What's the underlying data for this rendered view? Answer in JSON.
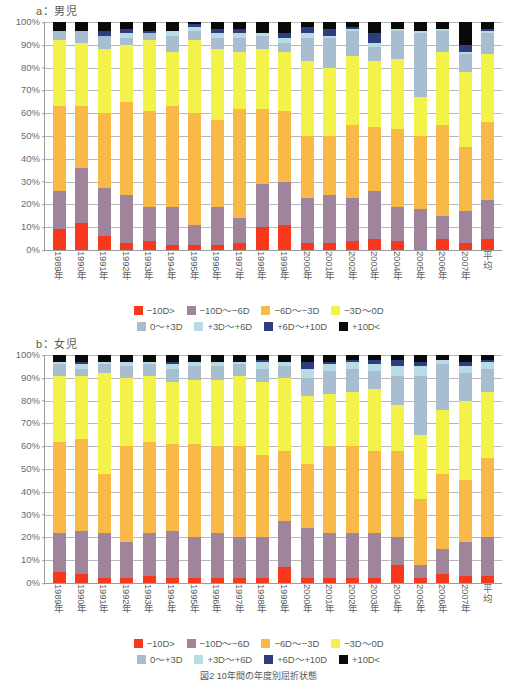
{
  "figure": {
    "caption": "図2 10年間の年度別屈折状態"
  },
  "axis": {
    "yticks": [
      "100%",
      "90%",
      "80%",
      "70%",
      "60%",
      "50%",
      "40%",
      "30%",
      "20%",
      "10%",
      "0%"
    ],
    "categories": [
      "1989年",
      "1990年",
      "1991年",
      "1992年",
      "1993年",
      "1994年",
      "1995年",
      "1996年",
      "1997年",
      "1998年",
      "1999年",
      "2000年",
      "2001年",
      "2002年",
      "2003年",
      "2004年",
      "2005年",
      "2006年",
      "2007年",
      "平均"
    ]
  },
  "legend": {
    "row1": [
      {
        "label": "−10D>",
        "color": "#f8381c"
      },
      {
        "label": "−10D〜−6D",
        "color": "#a0849b"
      },
      {
        "label": "−6D〜−3D",
        "color": "#f9b949"
      },
      {
        "label": "−3D〜0D",
        "color": "#f2f24a"
      }
    ],
    "row2": [
      {
        "label": "0〜+3D",
        "color": "#a8bdd0"
      },
      {
        "label": "+3D〜+6D",
        "color": "#b8dce4"
      },
      {
        "label": "+6D〜+10D",
        "color": "#2e3c80"
      },
      {
        "label": "+10D<",
        "color": "#0a0a0a"
      }
    ]
  },
  "panels": [
    {
      "id": "a",
      "title": "a：男児"
    },
    {
      "id": "b",
      "title": "b：女児"
    }
  ],
  "chart_data": [
    {
      "type": "bar",
      "stacked": true,
      "normalized": true,
      "title": "a：男児",
      "xlabel": "",
      "ylabel": "",
      "ylim": [
        0,
        100
      ],
      "grid": true,
      "legend_position": "bottom",
      "categories": [
        "1989年",
        "1990年",
        "1991年",
        "1992年",
        "1993年",
        "1994年",
        "1995年",
        "1996年",
        "1997年",
        "1998年",
        "1999年",
        "2000年",
        "2001年",
        "2002年",
        "2003年",
        "2004年",
        "2005年",
        "2006年",
        "2007年",
        "平均"
      ],
      "series": [
        {
          "name": "−10D>",
          "color": "#f8381c",
          "values": [
            9,
            12,
            6,
            3,
            4,
            2,
            2,
            2,
            3,
            10,
            11,
            3,
            3,
            4,
            5,
            4,
            0,
            5,
            3,
            5
          ]
        },
        {
          "name": "−10D〜−6D",
          "color": "#a0849b",
          "values": [
            17,
            24,
            21,
            21,
            15,
            17,
            9,
            17,
            11,
            19,
            19,
            20,
            21,
            19,
            21,
            15,
            18,
            10,
            14,
            17
          ]
        },
        {
          "name": "−6D〜−3D",
          "color": "#f9b949",
          "values": [
            37,
            27,
            33,
            41,
            42,
            44,
            49,
            38,
            48,
            33,
            31,
            27,
            26,
            32,
            28,
            34,
            32,
            40,
            28,
            34
          ]
        },
        {
          "name": "−3D〜0D",
          "color": "#f2f24a",
          "values": [
            29,
            28,
            28,
            25,
            31,
            24,
            32,
            31,
            25,
            26,
            26,
            33,
            30,
            30,
            29,
            31,
            17,
            32,
            33,
            30
          ]
        },
        {
          "name": "0〜+3D",
          "color": "#a8bdd0",
          "values": [
            4,
            5,
            6,
            3,
            3,
            7,
            4,
            5,
            6,
            6,
            4,
            10,
            13,
            11,
            6,
            12,
            28,
            9,
            8,
            9
          ]
        },
        {
          "name": "+3D〜+6D",
          "color": "#b8dce4",
          "values": [
            0,
            0,
            0,
            2,
            0,
            2,
            2,
            2,
            2,
            1,
            2,
            2,
            1,
            1,
            2,
            1,
            1,
            1,
            1,
            1
          ]
        },
        {
          "name": "+6D〜+10D",
          "color": "#2e3c80",
          "values": [
            0,
            0,
            2,
            2,
            1,
            0,
            1,
            2,
            2,
            0,
            2,
            3,
            3,
            1,
            4,
            0,
            0,
            0,
            3,
            1
          ]
        },
        {
          "name": "+10D<",
          "color": "#0a0a0a",
          "values": [
            4,
            4,
            4,
            3,
            4,
            4,
            1,
            3,
            3,
            5,
            5,
            2,
            3,
            2,
            5,
            3,
            4,
            3,
            10,
            3
          ]
        }
      ]
    },
    {
      "type": "bar",
      "stacked": true,
      "normalized": true,
      "title": "b：女児",
      "xlabel": "",
      "ylabel": "",
      "ylim": [
        0,
        100
      ],
      "grid": true,
      "legend_position": "bottom",
      "categories": [
        "1989年",
        "1990年",
        "1991年",
        "1992年",
        "1993年",
        "1994年",
        "1995年",
        "1996年",
        "1997年",
        "1998年",
        "1999年",
        "2000年",
        "2001年",
        "2002年",
        "2003年",
        "2004年",
        "2005年",
        "2006年",
        "2007年",
        "平均"
      ],
      "series": [
        {
          "name": "−10D>",
          "color": "#f8381c",
          "values": [
            5,
            4,
            2,
            2,
            3,
            2,
            2,
            2,
            2,
            2,
            7,
            2,
            2,
            2,
            2,
            8,
            2,
            4,
            3,
            3
          ]
        },
        {
          "name": "−10D〜−6D",
          "color": "#a0849b",
          "values": [
            17,
            19,
            20,
            16,
            19,
            21,
            18,
            20,
            18,
            18,
            20,
            22,
            20,
            20,
            20,
            12,
            6,
            11,
            15,
            17
          ]
        },
        {
          "name": "−6D〜−3D",
          "color": "#f9b949",
          "values": [
            40,
            40,
            26,
            42,
            40,
            38,
            41,
            38,
            40,
            36,
            31,
            28,
            38,
            38,
            36,
            38,
            29,
            33,
            27,
            35
          ]
        },
        {
          "name": "−3D〜0D",
          "color": "#f2f24a",
          "values": [
            29,
            28,
            44,
            30,
            29,
            27,
            28,
            29,
            31,
            32,
            32,
            30,
            23,
            24,
            27,
            20,
            28,
            28,
            35,
            29
          ]
        },
        {
          "name": "0〜+3D",
          "color": "#a8bdd0",
          "values": [
            5,
            3,
            4,
            5,
            5,
            6,
            6,
            6,
            5,
            6,
            5,
            8,
            10,
            10,
            8,
            13,
            26,
            20,
            12,
            10
          ]
        },
        {
          "name": "+3D〜+6D",
          "color": "#b8dce4",
          "values": [
            1,
            2,
            1,
            2,
            1,
            2,
            2,
            2,
            1,
            3,
            2,
            4,
            3,
            3,
            3,
            4,
            4,
            2,
            3,
            3
          ]
        },
        {
          "name": "+6D〜+10D",
          "color": "#2e3c80",
          "values": [
            0,
            1,
            0,
            0,
            0,
            1,
            0,
            0,
            0,
            1,
            0,
            3,
            1,
            1,
            2,
            3,
            2,
            0,
            2,
            1
          ]
        },
        {
          "name": "+10D<",
          "color": "#0a0a0a",
          "values": [
            3,
            3,
            3,
            3,
            3,
            3,
            3,
            3,
            3,
            2,
            3,
            3,
            3,
            2,
            2,
            2,
            3,
            2,
            3,
            2
          ]
        }
      ]
    }
  ]
}
